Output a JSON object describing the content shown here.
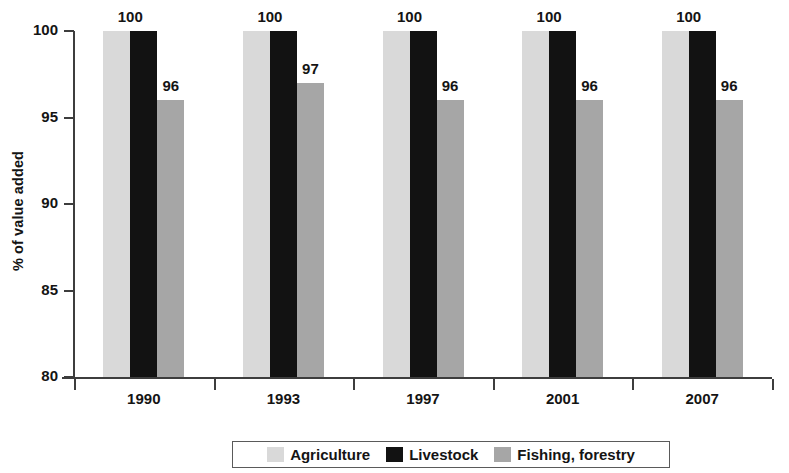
{
  "chart_data": {
    "type": "bar",
    "title": "",
    "subtitle": "",
    "xlabel": "",
    "ylabel": "% of value added",
    "categories": [
      "1990",
      "1993",
      "1997",
      "2001",
      "2007"
    ],
    "series": [
      {
        "name": "Agriculture",
        "color": "#d9d9d9",
        "values": [
          100,
          100,
          100,
          100,
          100
        ],
        "labels": [
          "",
          "",
          "",
          "",
          ""
        ]
      },
      {
        "name": "Livestock",
        "color": "#121212",
        "values": [
          100,
          100,
          100,
          100,
          100
        ],
        "labels": [
          "100",
          "100",
          "100",
          "100",
          "100"
        ]
      },
      {
        "name": "Fishing, forestry",
        "color": "#a6a6a6",
        "values": [
          96,
          97,
          96,
          96,
          96
        ],
        "labels": [
          "96",
          "97",
          "96",
          "96",
          "96"
        ]
      }
    ],
    "ylim": [
      80,
      100
    ],
    "yticks": [
      "80",
      "85",
      "90",
      "95",
      "100"
    ],
    "grid": false,
    "legend_position": "bottom"
  },
  "legend": {
    "items": [
      {
        "label": "Agriculture",
        "color": "#d9d9d9"
      },
      {
        "label": "Livestock",
        "color": "#121212"
      },
      {
        "label": "Fishing, forestry",
        "color": "#a6a6a6"
      }
    ]
  }
}
